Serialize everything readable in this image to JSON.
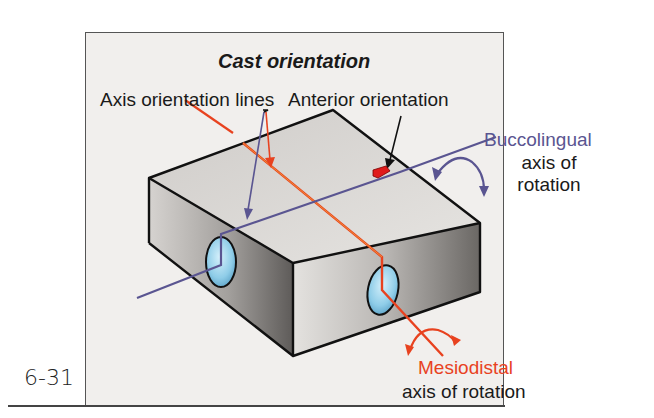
{
  "figure": {
    "title": "Cast orientation",
    "figure_number": "6-31",
    "labels": {
      "axis_orientation_lines": "Axis orientation lines",
      "anterior_orientation": "Anterior orientation",
      "buccolingual": "Buccolingual",
      "buccolingual_axis_line1": "axis of",
      "buccolingual_axis_line2": "rotation",
      "mesiodistal": "Mesiodistal",
      "mesiodistal_axis": "axis of rotation"
    },
    "colors": {
      "background": "#f1efed",
      "box_top": "#d9d6d3",
      "box_side_dark": "#8a8784",
      "buccolingual_axis": "#5a5591",
      "mesiodistal_axis": "#e8421f",
      "hole": "#8fcde8",
      "outline": "#111111"
    }
  }
}
